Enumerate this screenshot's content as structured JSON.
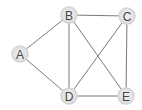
{
  "graph": {
    "nodes": [
      {
        "id": "A",
        "label": "A",
        "x": 20,
        "y": 54
      },
      {
        "id": "B",
        "label": "B",
        "x": 69,
        "y": 15
      },
      {
        "id": "C",
        "label": "C",
        "x": 127,
        "y": 16
      },
      {
        "id": "D",
        "label": "D",
        "x": 69,
        "y": 96
      },
      {
        "id": "E",
        "label": "E",
        "x": 126,
        "y": 96
      }
    ],
    "edges": [
      [
        "A",
        "B"
      ],
      [
        "A",
        "D"
      ],
      [
        "B",
        "C"
      ],
      [
        "B",
        "D"
      ],
      [
        "B",
        "E"
      ],
      [
        "C",
        "D"
      ],
      [
        "C",
        "E"
      ],
      [
        "D",
        "E"
      ]
    ],
    "colors": {
      "edge": "#7a7a7a",
      "node_fill": "#e6e6e6",
      "node_border": "#d4d4d4",
      "label": "#444444"
    }
  }
}
